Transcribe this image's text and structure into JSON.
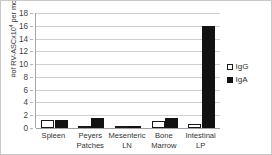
{
  "chart_data": {
    "type": "bar",
    "title": "",
    "xlabel": "",
    "ylabel": "#of RV-ASCx10⁴ per mouse",
    "ylabel_base": "#of RV-ASCx10",
    "ylabel_exponent": "4",
    "ylabel_tail": " per mouse",
    "categories": [
      "Spleen",
      "Peyers Patches",
      "Mesenteric LN",
      "Bone Marrow",
      "Intestinal LP"
    ],
    "category_lines": [
      [
        "Spleen"
      ],
      [
        "Peyers",
        "Patches"
      ],
      [
        "Mesenteric",
        "LN"
      ],
      [
        "Bone",
        "Marrow"
      ],
      [
        "Intestinal",
        "LP"
      ]
    ],
    "series": [
      {
        "name": "IgG",
        "color": "#ffffff",
        "edge_color": "#1a1a1a",
        "values": [
          1.2,
          0.15,
          0.05,
          1.1,
          0.7
        ]
      },
      {
        "name": "IgA",
        "color": "#121212",
        "edge_color": "#121212",
        "values": [
          1.3,
          1.6,
          0.1,
          1.6,
          16.0
        ]
      }
    ],
    "ylim": [
      0,
      18
    ],
    "yticks": [
      0,
      2,
      4,
      6,
      8,
      10,
      12,
      14,
      16,
      18
    ],
    "ytick_labels": [
      "0",
      "2",
      "4",
      "6",
      "8",
      "10",
      "12",
      "14",
      "16",
      "18"
    ],
    "grid": true,
    "grid_axis": "y",
    "legend": [
      "IgG",
      "IgA"
    ],
    "legend_position": "right"
  },
  "legend": {
    "items": [
      {
        "label": "IgG",
        "marker": "open-square-icon"
      },
      {
        "label": "IgA",
        "marker": "filled-square-icon"
      }
    ]
  }
}
